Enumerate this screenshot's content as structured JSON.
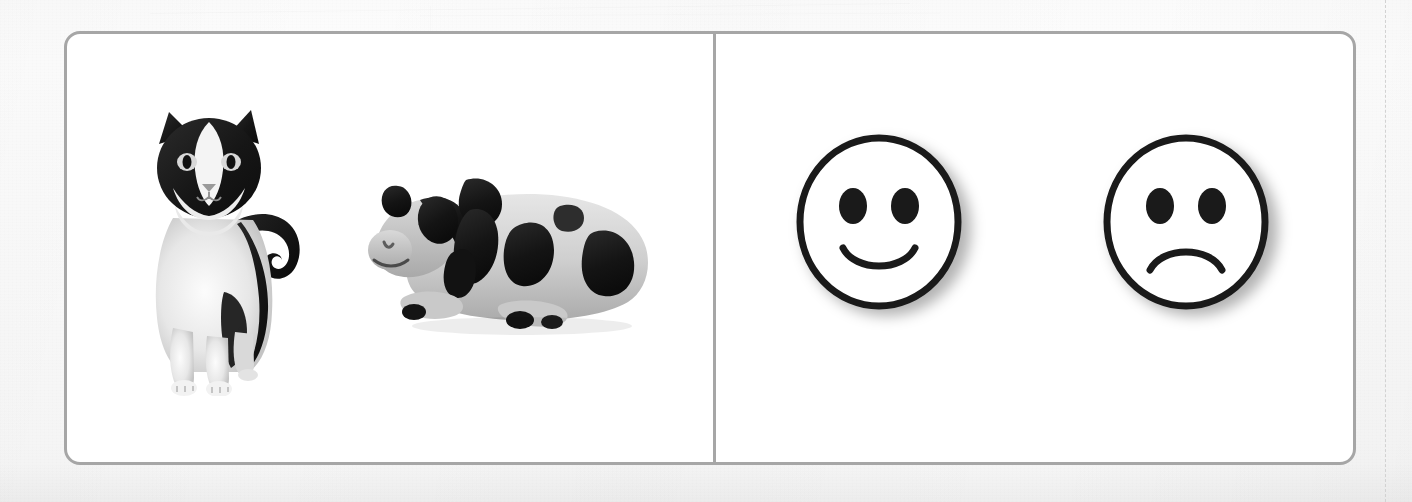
{
  "sheet": {
    "background_color": "#fafafa",
    "cut_line_color": "#d2d2d2"
  },
  "card": {
    "border_color": "#a6a6a6",
    "fill_color": "#ffffff",
    "divider_color": "#a6a6a6",
    "corner_radius_px": 16
  },
  "panels": [
    {
      "name": "stimulus-panel",
      "position": "left",
      "items": [
        {
          "id": "cat",
          "label": "cat",
          "type": "photograph",
          "description": "Black and white tuxedo cat standing and facing forward with its tail raised",
          "colors": {
            "fur_dark": "#1c1c1c",
            "fur_light": "#efefef",
            "shading": "#b9b9b9"
          }
        },
        {
          "id": "cow",
          "label": "cow",
          "type": "photograph",
          "description": "Black and white toy cow figurine lying down, facing left",
          "colors": {
            "patch_dark": "#161616",
            "body_light": "#d8d8d8",
            "shading": "#9d9d9d"
          }
        }
      ]
    },
    {
      "name": "response-panel",
      "position": "right",
      "items": [
        {
          "id": "happy-face",
          "label": "happy face",
          "type": "symbol",
          "expression": "smiling",
          "description": "Round line-drawn smiley face with two oval eyes and an upward curved mouth",
          "colors": {
            "outline": "#1a1a1a",
            "fill": "#ffffff",
            "shadow": "#4d4d4d"
          }
        },
        {
          "id": "sad-face",
          "label": "sad face",
          "type": "symbol",
          "expression": "frowning",
          "description": "Round line-drawn sad face with two oval eyes and a downward curved mouth",
          "colors": {
            "outline": "#1a1a1a",
            "fill": "#ffffff",
            "shadow": "#4d4d4d"
          }
        }
      ]
    }
  ]
}
